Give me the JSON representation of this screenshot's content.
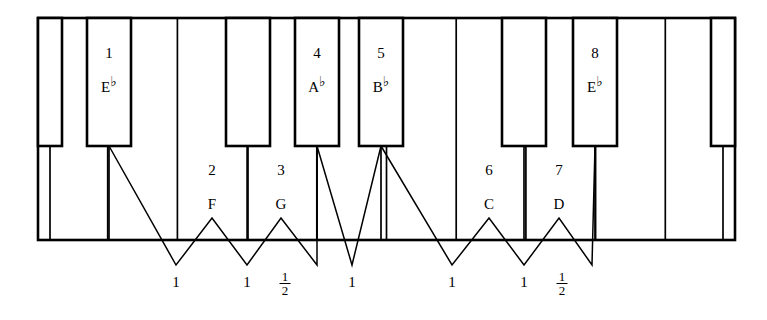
{
  "diagram": {
    "type": "piano-keyboard-scale-diagram",
    "ink_color": "#000000",
    "background_color": "#ffffff",
    "white_key_count": 10,
    "black_key_count": 7
  },
  "scale_degrees": [
    {
      "number": "1",
      "note": "E",
      "accidental": "♭",
      "key_type": "black"
    },
    {
      "number": "2",
      "note": "F",
      "accidental": "",
      "key_type": "white"
    },
    {
      "number": "3",
      "note": "G",
      "accidental": "",
      "key_type": "white"
    },
    {
      "number": "4",
      "note": "A",
      "accidental": "♭",
      "key_type": "black"
    },
    {
      "number": "5",
      "note": "B",
      "accidental": "♭",
      "key_type": "black"
    },
    {
      "number": "6",
      "note": "C",
      "accidental": "",
      "key_type": "white"
    },
    {
      "number": "7",
      "note": "D",
      "accidental": "",
      "key_type": "white"
    },
    {
      "number": "8",
      "note": "E",
      "accidental": "♭",
      "key_type": "black"
    }
  ],
  "labels": {
    "d1_num": "1",
    "d1_note": "E",
    "d1_flat": "♭",
    "d2_num": "2",
    "d2_note": "F",
    "d3_num": "3",
    "d3_note": "G",
    "d4_num": "4",
    "d4_note": "A",
    "d4_flat": "♭",
    "d5_num": "5",
    "d5_note": "B",
    "d5_flat": "♭",
    "d6_num": "6",
    "d6_note": "C",
    "d7_num": "7",
    "d7_note": "D",
    "d8_num": "8",
    "d8_note": "E",
    "d8_flat": "♭"
  },
  "intervals": [
    {
      "id": "i1",
      "value": "1",
      "whole": true,
      "numerator": "",
      "denominator": ""
    },
    {
      "id": "i2",
      "value": "1",
      "whole": true,
      "numerator": "",
      "denominator": ""
    },
    {
      "id": "i3",
      "value": "1/2",
      "whole": false,
      "numerator": "1",
      "denominator": "2"
    },
    {
      "id": "i4",
      "value": "1",
      "whole": true,
      "numerator": "",
      "denominator": ""
    },
    {
      "id": "i5",
      "value": "1",
      "whole": true,
      "numerator": "",
      "denominator": ""
    },
    {
      "id": "i6",
      "value": "1",
      "whole": true,
      "numerator": "",
      "denominator": ""
    },
    {
      "id": "i7",
      "value": "1/2",
      "whole": false,
      "numerator": "1",
      "denominator": "2"
    }
  ],
  "interval_text": {
    "i1": "1",
    "i2": "1",
    "i3_num": "1",
    "i3_den": "2",
    "i4": "1",
    "i5": "1",
    "i6": "1",
    "i7_num": "1",
    "i7_den": "2"
  }
}
